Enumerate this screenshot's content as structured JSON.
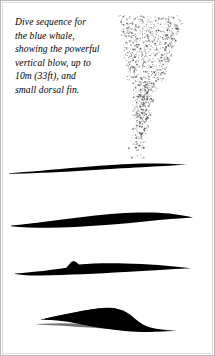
{
  "figure": {
    "caption": "Dive sequence for\nthe blue whale,\nshowing the powerful\nvertical blow, up to\n10m (33ft), and\nsmall dorsal fin.",
    "caption_lines": [
      "Dive sequence for",
      "the blue whale,",
      "showing the powerful",
      "vertical blow, up to",
      "10m (33ft), and",
      "small dorsal fin."
    ],
    "subject": "blue whale",
    "blow_height": "10m (33ft)",
    "background_color": "#ffffff",
    "ink_color": "#000000",
    "border_color": "#b9b9b9",
    "inner_border_color": "#dcdcdc",
    "spray_color": "#4a4a4a",
    "panels": [
      {
        "name": "whale-stage-1-blowing",
        "description": "Whale at surface with tall vertical blow spray"
      },
      {
        "name": "whale-stage-2-surfacing",
        "description": "Whale back arched at surface, lens shaped silhouette"
      },
      {
        "name": "whale-stage-3-dorsal-fin",
        "description": "Whale showing small dorsal fin as it rolls forward"
      },
      {
        "name": "whale-stage-4-diving",
        "description": "Whale arching steeply to begin the dive"
      }
    ],
    "spray": {
      "name": "vertical-blow-spray",
      "seed": 20250607,
      "dot_count": 1150,
      "origin_x": 139,
      "origin_y": 160,
      "top_y": 14,
      "column_half_width": 11,
      "plume_half_width": 34
    }
  }
}
